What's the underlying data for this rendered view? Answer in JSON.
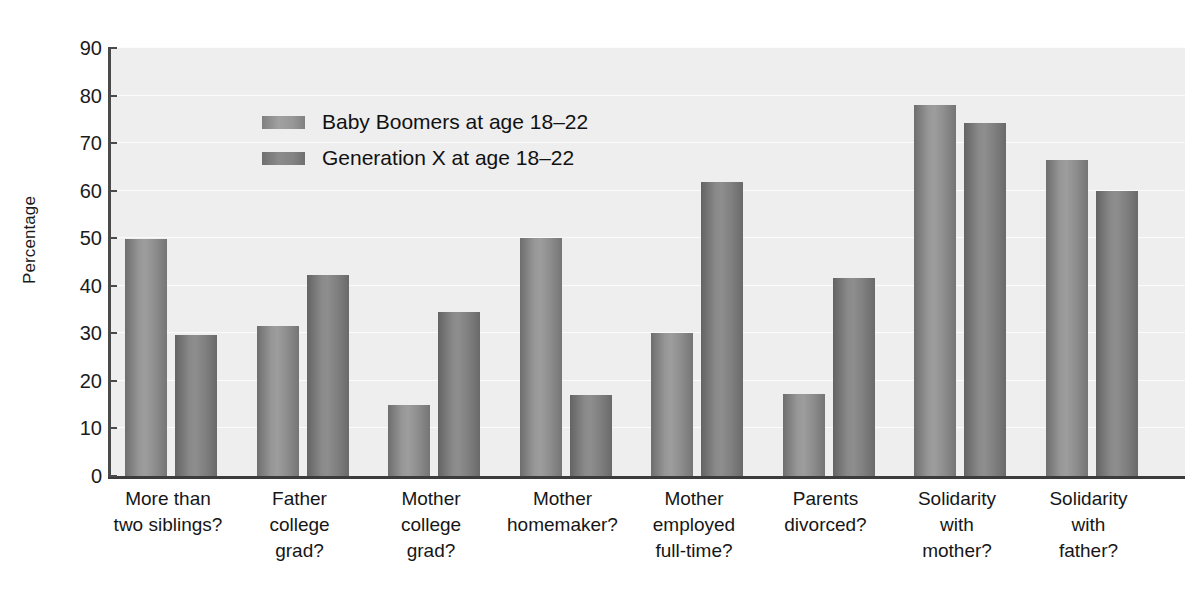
{
  "chart_data": {
    "type": "bar",
    "title": "",
    "xlabel": "",
    "ylabel": "Percentage",
    "ylim": [
      0,
      90
    ],
    "yticks": [
      0,
      10,
      20,
      30,
      40,
      50,
      60,
      70,
      80,
      90
    ],
    "grid": true,
    "legend_position": "upper-left-inside",
    "categories": [
      "More than two siblings?",
      "Father college grad?",
      "Mother college grad?",
      "Mother homemaker?",
      "Mother employed full-time?",
      "Parents divorced?",
      "Solidarity with mother?",
      "Solidarity with father?"
    ],
    "category_lines": [
      [
        "More than",
        "two siblings?"
      ],
      [
        "Father",
        "college",
        "grad?"
      ],
      [
        "Mother",
        "college",
        "grad?"
      ],
      [
        "Mother",
        "homemaker?"
      ],
      [
        "Mother",
        "employed",
        "full-time?"
      ],
      [
        "Parents",
        "divorced?"
      ],
      [
        "Solidarity",
        "with",
        "mother?"
      ],
      [
        "Solidarity",
        "with",
        "father?"
      ]
    ],
    "series": [
      {
        "name": "Baby Boomers at age 18–22",
        "color": "#9d9d9d",
        "values": [
          49.8,
          31.5,
          15.0,
          50.0,
          30.0,
          17.3,
          78.0,
          66.5
        ]
      },
      {
        "name": "Generation X at age 18–22",
        "color": "#8e8e8e",
        "values": [
          29.7,
          42.3,
          34.4,
          17.1,
          61.8,
          41.6,
          74.2,
          59.9
        ]
      }
    ]
  },
  "legend": {
    "items": [
      {
        "label": "Baby Boomers at age 18–22"
      },
      {
        "label": "Generation X at age 18–22"
      }
    ]
  },
  "axes": {
    "y_title": "Percentage"
  },
  "colors": {
    "plot_background": "#eeeeee",
    "axis": "#3c3c3c",
    "gridline": "#fbfbfb",
    "series_0": "#9d9d9d",
    "series_1": "#8e8e8e"
  }
}
